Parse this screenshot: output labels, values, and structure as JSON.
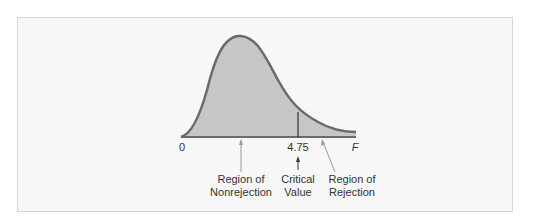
{
  "diagram": {
    "type": "F-distribution",
    "axis": {
      "origin_label": "0",
      "variable_label": "F",
      "critical_value_tick": "4.75"
    },
    "annotations": {
      "nonrejection": [
        "Region of",
        "Nonrejection"
      ],
      "critical": [
        "Critical",
        "Value"
      ],
      "rejection": [
        "Region of",
        "Rejection"
      ]
    },
    "colors": {
      "fill": "#c6c6c6",
      "curve": "#6a6a6a",
      "background": "#f7f7f7",
      "frame_border": "#d6d6d6"
    }
  }
}
